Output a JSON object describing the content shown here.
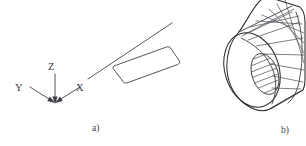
{
  "figure": {
    "background_color": "#ffffff",
    "line_color": "#3f3f46",
    "width": 306,
    "height": 146,
    "panels": [
      {
        "id": "a",
        "caption": "a)",
        "caption_x": 92,
        "caption_y": 131,
        "description": "coordinate axis tripod with flat rectangular plate"
      },
      {
        "id": "b",
        "caption": "b)",
        "caption_x": 281,
        "caption_y": 133,
        "description": "bladed cylindrical hub with hatched bore"
      }
    ],
    "axes": {
      "origin_x": 55,
      "origin_y": 103,
      "labels": [
        {
          "name": "z-axis-label",
          "text": "Z",
          "x": 48,
          "y": 70
        },
        {
          "name": "y-axis-label",
          "text": "Y",
          "x": 15,
          "y": 91
        },
        {
          "name": "x-axis-label",
          "text": "X",
          "x": 76,
          "y": 91
        }
      ]
    }
  }
}
